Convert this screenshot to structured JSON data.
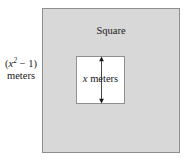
{
  "figure": {
    "title_label": "Square",
    "outer_dimension": {
      "expression_open": "(",
      "variable": "x",
      "exponent": "2",
      "operator": " − 1)",
      "unit": "meters"
    },
    "inner_dimension": {
      "variable": "x",
      "unit": " meters"
    },
    "colors": {
      "outer_fill": "#d8d8d8",
      "outer_stroke": "#8e8e8e",
      "inner_fill": "#ffffff",
      "inner_stroke": "#909090",
      "arrow": "#1a1a1a",
      "text": "#1a1a1a",
      "background": "#ffffff"
    },
    "icons": {
      "double_headed_arrow": "vertical-double-arrow-icon"
    }
  }
}
